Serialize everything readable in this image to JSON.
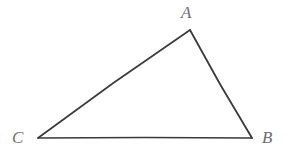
{
  "figure": {
    "kind": "geometry-diagram",
    "shape": "triangle",
    "background_color": "#ffffff",
    "stroke_color": "#3a3a3a",
    "stroke_width": 1.6,
    "label_color": "#6d6d6d",
    "canvas": {
      "width": 286,
      "height": 153
    },
    "vertices": [
      {
        "id": "A",
        "label": "A",
        "x": 190,
        "y": 30,
        "label_x": 190,
        "label_y": 12,
        "label_position": "above"
      },
      {
        "id": "B",
        "label": "B",
        "x": 252,
        "y": 138,
        "label_x": 270,
        "label_y": 138,
        "label_position": "right"
      },
      {
        "id": "C",
        "label": "C",
        "x": 38,
        "y": 138,
        "label_x": 20,
        "label_y": 138,
        "label_position": "left"
      }
    ],
    "edges": [
      {
        "id": "CA",
        "from": "C",
        "to": "A"
      },
      {
        "id": "AB",
        "from": "A",
        "to": "B"
      },
      {
        "id": "BC",
        "from": "B",
        "to": "C"
      }
    ]
  }
}
